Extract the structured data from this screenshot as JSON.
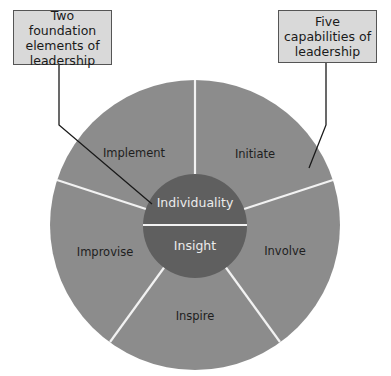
{
  "diagram": {
    "callouts": {
      "left": "Two foundation elements of leadership",
      "right": "Five capabilities of leadership"
    },
    "foundation_elements": [
      "Individuality",
      "Insight"
    ],
    "capabilities": [
      "Initiate",
      "Involve",
      "Inspire",
      "Improvise",
      "Implement"
    ],
    "colors": {
      "outer_ring": "#8c8c8c",
      "inner_core": "#5f5f5f",
      "dividers": "#f2f2f2",
      "callout_fill": "#d9d9d9",
      "callout_border": "#555555",
      "leader_lines": "#1a1a1a"
    }
  }
}
